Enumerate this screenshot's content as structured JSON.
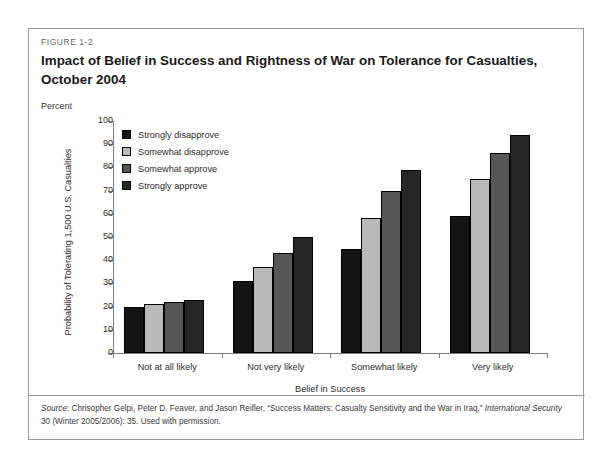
{
  "figure": {
    "number": "FIGURE 1-2",
    "title": "Impact of Belief in Success and Rightness of War on Tolerance for Casualties, October 2004",
    "percent_label": "Percent"
  },
  "source": {
    "label": "Source",
    "text_part1": ": Chrisopher Gelpi, Peter D. Feaver, and Jason Reifler, “Success Matters: Casualty Sensitivity and the War in Iraq,” ",
    "journal": "International Security",
    "text_part2": " 30 (Winter 2005/2006): 35. Used with permission."
  },
  "colors": {
    "strongly_disapprove": "#141414",
    "somewhat_disapprove": "#b9b9b9",
    "somewhat_approve": "#565656",
    "strongly_approve": "#262626",
    "axis": "#7d7d7d",
    "frame": "#9a9a9a",
    "text": "#2e2e2e"
  },
  "chart_data": {
    "type": "bar",
    "title": "Impact of Belief in Success and Rightness of War on Tolerance for Casualties, October 2004",
    "xlabel": "Belief in Success",
    "ylabel": "Probability of Tolerating 1,500 U.S. Casualties",
    "unit_label": "Percent",
    "ylim": [
      0,
      100
    ],
    "yticks": [
      0,
      10,
      20,
      30,
      40,
      50,
      60,
      70,
      80,
      90,
      100
    ],
    "grid": false,
    "legend_position": "upper-left-inside",
    "categories": [
      "Not at all likely",
      "Not very likely",
      "Somewhat likely",
      "Very likely"
    ],
    "series": [
      {
        "name": "Strongly disapprove",
        "color": "#141414",
        "values": [
          20,
          31,
          45,
          59
        ]
      },
      {
        "name": "Somewhat disapprove",
        "color": "#b9b9b9",
        "values": [
          21,
          37,
          58,
          75
        ]
      },
      {
        "name": "Somewhat approve",
        "color": "#565656",
        "values": [
          22,
          43,
          70,
          86
        ]
      },
      {
        "name": "Strongly approve",
        "color": "#262626",
        "values": [
          23,
          50,
          79,
          94
        ]
      }
    ]
  }
}
